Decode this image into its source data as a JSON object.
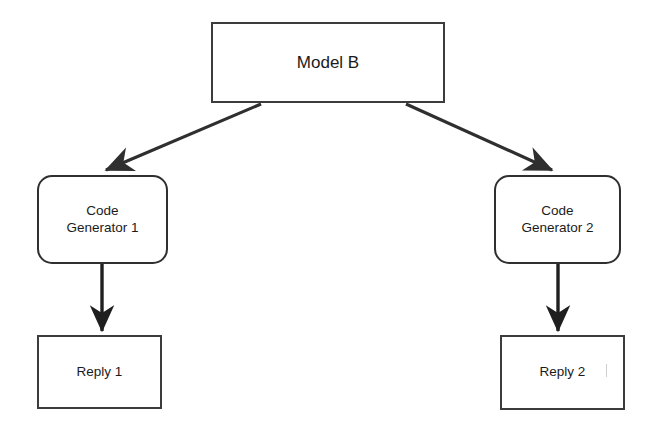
{
  "diagram": {
    "title": "Model B",
    "background_color": "#ffffff",
    "stroke_color": "#2f2f2f",
    "text_color": "#1b1b1b",
    "nodes": [
      {
        "id": "model-b",
        "label": "Model B",
        "shape": "rectangle"
      },
      {
        "id": "code-generator-1",
        "label": "Code\nGenerator 1",
        "shape": "rounded-rectangle"
      },
      {
        "id": "code-generator-2",
        "label": "Code\nGenerator 2",
        "shape": "rounded-rectangle"
      },
      {
        "id": "reply-1",
        "label": "Reply 1",
        "shape": "rectangle"
      },
      {
        "id": "reply-2",
        "label": "Reply 2",
        "shape": "rectangle"
      }
    ],
    "edges": [
      {
        "id": "model-b-to-code-generator-1",
        "from": "model-b",
        "to": "code-generator-1",
        "style": "diagonal-arrow"
      },
      {
        "id": "model-b-to-code-generator-2",
        "from": "model-b",
        "to": "code-generator-2",
        "style": "diagonal-arrow"
      },
      {
        "id": "code-generator-1-to-reply-1",
        "from": "code-generator-1",
        "to": "reply-1",
        "style": "vertical-arrow"
      },
      {
        "id": "code-generator-2-to-reply-2",
        "from": "code-generator-2",
        "to": "reply-2",
        "style": "vertical-arrow"
      }
    ]
  }
}
